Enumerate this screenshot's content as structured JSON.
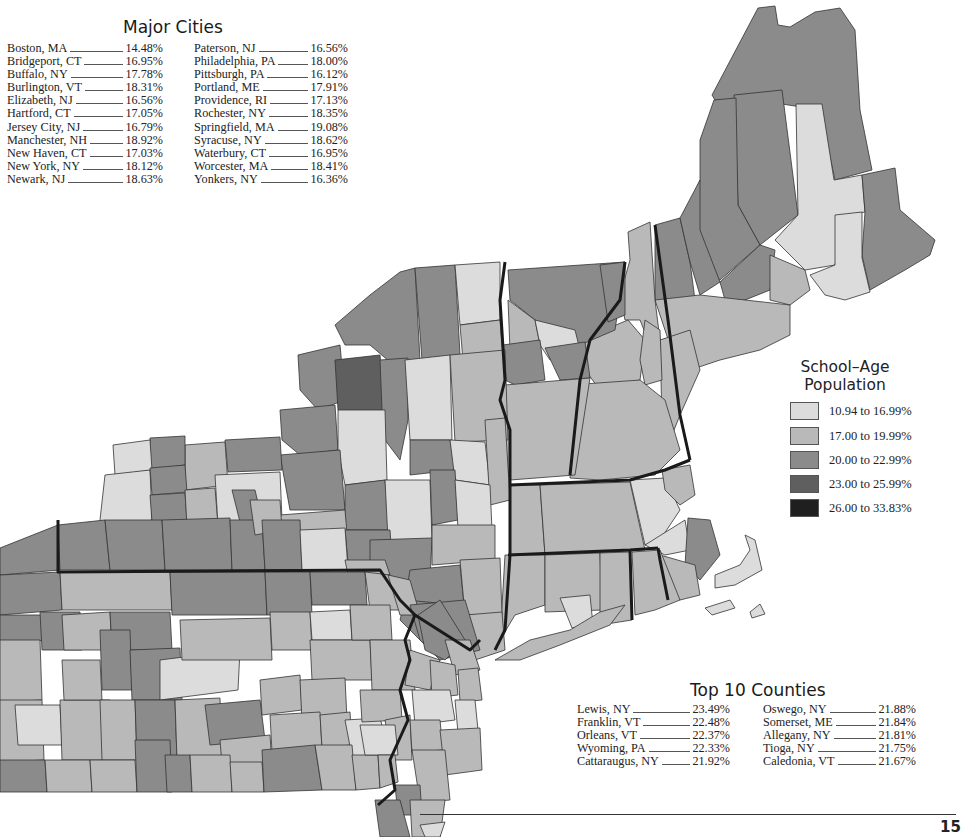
{
  "major_cities": {
    "title": "Major Cities",
    "left": [
      {
        "name": "Boston, MA",
        "value": "14.48%"
      },
      {
        "name": "Bridgeport, CT",
        "value": "16.95%"
      },
      {
        "name": "Buffalo, NY",
        "value": "17.78%"
      },
      {
        "name": "Burlington, VT",
        "value": "18.31%"
      },
      {
        "name": "Elizabeth, NJ",
        "value": "16.56%"
      },
      {
        "name": "Hartford, CT",
        "value": "17.05%"
      },
      {
        "name": "Jersey City, NJ",
        "value": "16.79%"
      },
      {
        "name": "Manchester, NH",
        "value": "18.92%"
      },
      {
        "name": "New Haven, CT",
        "value": "17.03%"
      },
      {
        "name": "New York, NY",
        "value": "18.12%"
      },
      {
        "name": "Newark, NJ",
        "value": "18.63%"
      }
    ],
    "right": [
      {
        "name": "Paterson, NJ",
        "value": "16.56%"
      },
      {
        "name": "Philadelphia, PA",
        "value": "18.00%"
      },
      {
        "name": "Pittsburgh, PA",
        "value": "16.12%"
      },
      {
        "name": "Portland, ME",
        "value": "17.91%"
      },
      {
        "name": "Providence, RI",
        "value": "17.13%"
      },
      {
        "name": "Rochester, NY",
        "value": "18.35%"
      },
      {
        "name": "Springfield, MA",
        "value": "19.08%"
      },
      {
        "name": "Syracuse, NY",
        "value": "18.62%"
      },
      {
        "name": "Waterbury, CT",
        "value": "16.95%"
      },
      {
        "name": "Worcester, MA",
        "value": "18.41%"
      },
      {
        "name": "Yonkers, NY",
        "value": "16.36%"
      }
    ]
  },
  "legend": {
    "title_line1": "School–Age",
    "title_line2": "Population",
    "items": [
      {
        "label": "10.94 to 16.99%",
        "color": "#dcdcdc"
      },
      {
        "label": "17.00 to 19.99%",
        "color": "#b9b9b9"
      },
      {
        "label": "20.00 to 22.99%",
        "color": "#8b8b8b"
      },
      {
        "label": "23.00 to 25.99%",
        "color": "#5f5f5f"
      },
      {
        "label": "26.00 to 33.83%",
        "color": "#1f1f1f"
      }
    ]
  },
  "top_counties": {
    "title": "Top 10 Counties",
    "left": [
      {
        "name": "Lewis, NY",
        "value": "23.49%"
      },
      {
        "name": "Franklin, VT",
        "value": "22.48%"
      },
      {
        "name": "Orleans, VT",
        "value": "22.37%"
      },
      {
        "name": "Wyoming, PA",
        "value": "22.33%"
      },
      {
        "name": "Cattaraugus, NY",
        "value": "21.92%"
      }
    ],
    "right": [
      {
        "name": "Oswego, NY",
        "value": "21.88%"
      },
      {
        "name": "Somerset, ME",
        "value": "21.84%"
      },
      {
        "name": "Allegany, NY",
        "value": "21.81%"
      },
      {
        "name": "Tioga, NY",
        "value": "21.75%"
      },
      {
        "name": "Caledonia, VT",
        "value": "21.67%"
      }
    ]
  },
  "page": {
    "number": "15"
  }
}
